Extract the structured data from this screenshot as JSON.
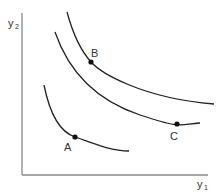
{
  "diagram": {
    "type": "indifference-curves",
    "axes": {
      "x_label": "y",
      "x_label_sub": "1",
      "y_label": "y",
      "y_label_sub": "2",
      "color": "#888888"
    },
    "curves": [
      {
        "name": "inner",
        "color": "#222222"
      },
      {
        "name": "middle",
        "color": "#222222"
      },
      {
        "name": "outer",
        "color": "#222222"
      }
    ],
    "points": [
      {
        "label": "A",
        "on_curve": "inner"
      },
      {
        "label": "B",
        "on_curve": "outer"
      },
      {
        "label": "C",
        "on_curve": "middle"
      }
    ]
  }
}
